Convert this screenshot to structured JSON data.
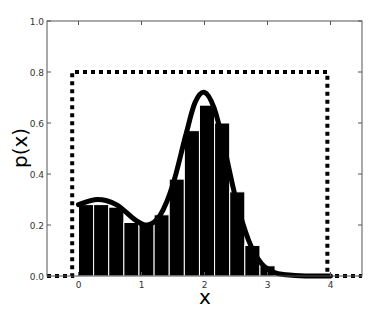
{
  "chart_data": {
    "type": "bar",
    "title": "",
    "xlabel": "x",
    "ylabel": "p(x)",
    "xlim": [
      -0.5,
      4.5
    ],
    "ylim": [
      0.0,
      1.0
    ],
    "xticks": [
      "0",
      "1",
      "2",
      "3",
      "4"
    ],
    "yticks": [
      "0.0",
      "0.2",
      "0.4",
      "0.6",
      "0.8",
      "1.0"
    ],
    "grid": false,
    "legend": null,
    "histogram": {
      "bin_width": 0.24,
      "bin_start": 0.0,
      "values": [
        0.28,
        0.28,
        0.27,
        0.21,
        0.21,
        0.24,
        0.38,
        0.57,
        0.67,
        0.6,
        0.33,
        0.12,
        0.04
      ],
      "color": "#000000",
      "edgecolor": "#ffffff"
    },
    "series": [
      {
        "name": "uniform proposal (dotted)",
        "style": "dotted",
        "x": [
          -0.5,
          -0.1,
          -0.1,
          3.95,
          3.95,
          4.5
        ],
        "values": [
          0.0,
          0.0,
          0.8,
          0.8,
          0.0,
          0.0
        ]
      },
      {
        "name": "target density (solid)",
        "style": "solid",
        "description": "bimodal mixture: peak ~0.30 near x=0.3, peak ~0.72 near x=2.0",
        "x": [
          0.0,
          0.3,
          0.6,
          0.9,
          1.1,
          1.3,
          1.5,
          1.7,
          1.85,
          2.0,
          2.15,
          2.3,
          2.5,
          2.7,
          2.9,
          3.1,
          3.3,
          3.6,
          4.0
        ],
        "values": [
          0.28,
          0.3,
          0.28,
          0.22,
          0.2,
          0.24,
          0.36,
          0.55,
          0.68,
          0.72,
          0.66,
          0.52,
          0.3,
          0.14,
          0.05,
          0.015,
          0.005,
          0.0,
          0.0
        ]
      }
    ]
  }
}
